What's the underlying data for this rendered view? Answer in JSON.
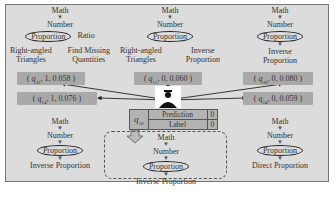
{
  "trees": {
    "top_left": {
      "path": [
        "Math",
        "Number"
      ],
      "highlight": "Proportion",
      "sibling": "Ratio",
      "children_left": [
        "Right-angled",
        "Triangles"
      ],
      "children_right": [
        "Find Missing",
        "Quantities"
      ]
    },
    "top_middle": {
      "path": [
        "Math",
        "Number"
      ],
      "highlight": "Proportion",
      "children_left": [
        "Right-angled",
        "Triangles"
      ],
      "children_right": [
        "Inverse",
        "Proportion"
      ]
    },
    "top_right": {
      "path": [
        "Math",
        "Number"
      ],
      "highlight": "Proportion",
      "children": [
        "Inverse",
        "Proportion"
      ]
    },
    "bottom_left": {
      "path": [
        "Math",
        "Number"
      ],
      "highlight": "Proportion",
      "leaf": "Inverse Proportion"
    },
    "bottom_middle": {
      "path": [
        "Math",
        "Number"
      ],
      "highlight": "Proportion",
      "leaf": "Inverse Proportion"
    },
    "bottom_right": {
      "path": [
        "Math",
        "Number"
      ],
      "highlight": "Proportion",
      "leaf": "Direct Proportion"
    }
  },
  "scores": {
    "top_left": {
      "q": "q",
      "sub": "31",
      "rest": ", 1, 0.058 )"
    },
    "top_middle": {
      "q": "q",
      "sub": "11",
      "rest": ", 0, 0.060 )"
    },
    "top_right": {
      "q": "q",
      "sub": "30",
      "rest": ", 0, 0.080 )"
    },
    "mid_left": {
      "q": "q",
      "sub": "14",
      "rest": ", 1, 0.076 )"
    },
    "mid_right": {
      "q": "q",
      "sub": "24",
      "rest": ", 0, 0.059 )"
    },
    "open": "( "
  },
  "target": {
    "q": "q",
    "sub": "10",
    "rows": [
      {
        "label": "Prediction",
        "value": "0"
      },
      {
        "label": "Label",
        "value": "0"
      }
    ]
  },
  "colors": {
    "panel": "#dcdcdc",
    "score_box": "#a9a9a9",
    "line": "#222222"
  }
}
